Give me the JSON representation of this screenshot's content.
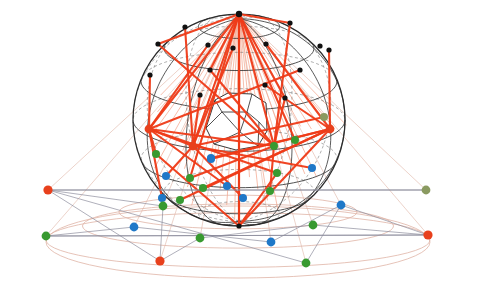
{
  "figure": {
    "background_color": "#ffffff",
    "width": 477,
    "height": 286
  },
  "palette": {
    "red": "#e8401c",
    "green": "#389a30",
    "blue": "#1f78c8",
    "olive": "#8a9a60",
    "black": "#111111",
    "wire_dark": "#333333",
    "wire_light": "#6b6b6b",
    "ray_strong": "#ef3b18",
    "ray_faint": "#f4a48c",
    "ground_curve": "#e0b4a6",
    "ground_chord": "#8a8a9a"
  },
  "sphere": {
    "center_x": 239,
    "center_y": 120,
    "radius": 106,
    "meridian_count": 12,
    "parallel_count": 7,
    "north_pole_x": 239,
    "north_pole_y": 14,
    "south_pole_x": 239,
    "south_pole_y": 226,
    "outline_color": "#2b2b2b"
  },
  "inner_cell": {
    "label": "inner-polyhedral-cell",
    "fill": "#ffffff",
    "stroke": "#222222",
    "vertex_count": 14
  },
  "lattice_nodes": [
    {
      "id": "n-pole-top",
      "x": 239,
      "y": 14,
      "color": "black",
      "r": 3.2
    },
    {
      "id": "n1",
      "x": 290,
      "y": 23,
      "color": "black",
      "r": 2.6
    },
    {
      "id": "n2",
      "x": 320,
      "y": 46,
      "color": "black",
      "r": 2.6
    },
    {
      "id": "n3",
      "x": 329,
      "y": 50,
      "color": "black",
      "r": 2.6
    },
    {
      "id": "n4",
      "x": 185,
      "y": 27,
      "color": "black",
      "r": 2.6
    },
    {
      "id": "n5",
      "x": 158,
      "y": 44,
      "color": "black",
      "r": 2.6
    },
    {
      "id": "n6",
      "x": 208,
      "y": 45,
      "color": "black",
      "r": 2.6
    },
    {
      "id": "n7",
      "x": 266,
      "y": 44,
      "color": "black",
      "r": 2.6
    },
    {
      "id": "n8",
      "x": 233,
      "y": 48,
      "color": "black",
      "r": 2.6
    },
    {
      "id": "n9",
      "x": 210,
      "y": 70,
      "color": "black",
      "r": 2.6
    },
    {
      "id": "n10",
      "x": 150,
      "y": 75,
      "color": "black",
      "r": 2.6
    },
    {
      "id": "n11",
      "x": 265,
      "y": 85,
      "color": "black",
      "r": 2.6
    },
    {
      "id": "n12",
      "x": 200,
      "y": 95,
      "color": "black",
      "r": 2.6
    },
    {
      "id": "n13",
      "x": 285,
      "y": 98,
      "color": "black",
      "r": 2.6
    },
    {
      "id": "n14",
      "x": 300,
      "y": 70,
      "color": "black",
      "r": 2.6
    },
    {
      "id": "n15",
      "x": 239,
      "y": 226,
      "color": "black",
      "r": 2.6
    }
  ],
  "sphere_points": [
    {
      "id": "s1",
      "x": 149,
      "y": 129,
      "color": "red",
      "r": 4.4
    },
    {
      "id": "s2",
      "x": 156,
      "y": 154,
      "color": "green",
      "r": 4.0
    },
    {
      "id": "s3",
      "x": 330,
      "y": 129,
      "color": "red",
      "r": 4.4
    },
    {
      "id": "s4",
      "x": 324,
      "y": 117,
      "color": "olive",
      "r": 4.0
    },
    {
      "id": "s5",
      "x": 274,
      "y": 146,
      "color": "green",
      "r": 4.0
    },
    {
      "id": "s6",
      "x": 277,
      "y": 173,
      "color": "green",
      "r": 4.0
    },
    {
      "id": "s7",
      "x": 211,
      "y": 159,
      "color": "blue",
      "r": 4.0
    },
    {
      "id": "s8",
      "x": 166,
      "y": 176,
      "color": "blue",
      "r": 4.0
    },
    {
      "id": "s9",
      "x": 190,
      "y": 178,
      "color": "green",
      "r": 4.0
    },
    {
      "id": "s10",
      "x": 193,
      "y": 146,
      "color": "red",
      "r": 4.4
    },
    {
      "id": "s11",
      "x": 211,
      "y": 158,
      "color": "blue",
      "r": 4.0
    },
    {
      "id": "s12",
      "x": 243,
      "y": 198,
      "color": "blue",
      "r": 4.0
    },
    {
      "id": "s13",
      "x": 270,
      "y": 191,
      "color": "green",
      "r": 4.0
    },
    {
      "id": "s14",
      "x": 227,
      "y": 186,
      "color": "blue",
      "r": 4.0
    },
    {
      "id": "s15",
      "x": 203,
      "y": 188,
      "color": "green",
      "r": 4.0
    },
    {
      "id": "s16",
      "x": 312,
      "y": 168,
      "color": "blue",
      "r": 4.0
    },
    {
      "id": "s17",
      "x": 295,
      "y": 140,
      "color": "green",
      "r": 4.0
    },
    {
      "id": "s18",
      "x": 162,
      "y": 198,
      "color": "blue",
      "r": 4.0
    },
    {
      "id": "s19",
      "x": 180,
      "y": 200,
      "color": "green",
      "r": 4.0
    }
  ],
  "ground_points": [
    {
      "id": "g1",
      "x": 48,
      "y": 190,
      "color": "red",
      "r": 4.6
    },
    {
      "id": "g2",
      "x": 46,
      "y": 236,
      "color": "green",
      "r": 4.4
    },
    {
      "id": "g3",
      "x": 134,
      "y": 227,
      "color": "blue",
      "r": 4.4
    },
    {
      "id": "g4",
      "x": 160,
      "y": 261,
      "color": "red",
      "r": 4.6
    },
    {
      "id": "g5",
      "x": 163,
      "y": 206,
      "color": "green",
      "r": 4.4
    },
    {
      "id": "g6",
      "x": 200,
      "y": 238,
      "color": "green",
      "r": 4.4
    },
    {
      "id": "g7",
      "x": 271,
      "y": 242,
      "color": "blue",
      "r": 4.4
    },
    {
      "id": "g8",
      "x": 306,
      "y": 263,
      "color": "green",
      "r": 4.4
    },
    {
      "id": "g9",
      "x": 313,
      "y": 225,
      "color": "green",
      "r": 4.4
    },
    {
      "id": "g10",
      "x": 341,
      "y": 205,
      "color": "blue",
      "r": 4.4
    },
    {
      "id": "g11",
      "x": 426,
      "y": 190,
      "color": "olive",
      "r": 4.4
    },
    {
      "id": "g12",
      "x": 428,
      "y": 235,
      "color": "red",
      "r": 4.6
    }
  ],
  "ground_curves": {
    "label": "projected-ellipses",
    "ellipse_cx": 238,
    "ellipse_cy": 212,
    "ellipse_rx": 192,
    "ellipse_ry": 24,
    "count": 3
  },
  "rays": {
    "label": "chord-rays",
    "strong_count": 26,
    "faint_count": 30,
    "strong_width": 2.1,
    "faint_width": 0.8
  }
}
